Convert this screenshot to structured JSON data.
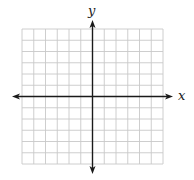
{
  "diagram": {
    "type": "coordinate-plane",
    "grid": {
      "columns": 12,
      "rows": 12,
      "line_color": "#c8c8c8",
      "left": 22,
      "top": 29,
      "right": 163,
      "bottom": 164
    },
    "axes": {
      "color": "#1a1a1a",
      "x_label": "x",
      "y_label": "y",
      "origin_col": 6,
      "origin_row": 6,
      "x_axis_start": 12,
      "x_axis_end": 173,
      "y_axis_start": 20,
      "y_axis_end": 174
    }
  }
}
